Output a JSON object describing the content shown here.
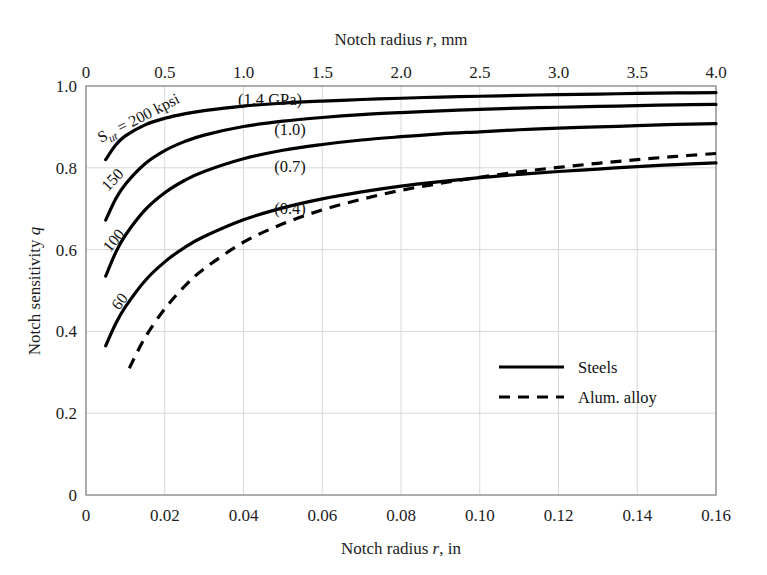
{
  "chart_data": {
    "type": "line",
    "title": "",
    "xlabel": "Notch radius r, in",
    "xlabel_top": "Notch radius r, mm",
    "ylabel": "Notch sensitivity q",
    "xlim": [
      0,
      0.16
    ],
    "ylim": [
      0,
      1.0
    ],
    "xlim_top": [
      0,
      4.0
    ],
    "grid": true,
    "legend_position": "center-right",
    "x_ticks": [
      "0",
      "0.02",
      "0.04",
      "0.06",
      "0.08",
      "0.10",
      "0.12",
      "0.14",
      "0.16"
    ],
    "x_tick_values": [
      0,
      0.02,
      0.04,
      0.06,
      0.08,
      0.1,
      0.12,
      0.14,
      0.16
    ],
    "x_ticks_top": [
      "0",
      "0.5",
      "1.0",
      "1.5",
      "2.0",
      "2.5",
      "3.0",
      "3.5",
      "4.0"
    ],
    "x_tick_values_top": [
      0,
      0.5,
      1.0,
      1.5,
      2.0,
      2.5,
      3.0,
      3.5,
      4.0
    ],
    "y_ticks": [
      "0",
      "0.2",
      "0.4",
      "0.6",
      "0.8",
      "1.0"
    ],
    "y_tick_values": [
      0,
      0.2,
      0.4,
      0.6,
      0.8,
      1.0
    ],
    "series": [
      {
        "name": "Sut = 200 kpsi",
        "label": "S_{ut} = 200 kpsi",
        "gpa_label": "(1.4 GPa)",
        "style": "solid",
        "x": [
          0.005,
          0.0075,
          0.01,
          0.015,
          0.02,
          0.025,
          0.03,
          0.04,
          0.05,
          0.06,
          0.07,
          0.08,
          0.09,
          0.1,
          0.11,
          0.12,
          0.13,
          0.14,
          0.15,
          0.16
        ],
        "y": [
          0.82,
          0.855,
          0.878,
          0.905,
          0.921,
          0.932,
          0.94,
          0.951,
          0.958,
          0.963,
          0.967,
          0.97,
          0.973,
          0.975,
          0.977,
          0.979,
          0.98,
          0.982,
          0.983,
          0.984
        ]
      },
      {
        "name": "Sut = 150 kpsi",
        "label": "150",
        "gpa_label": "(1.0)",
        "style": "solid",
        "x": [
          0.005,
          0.0075,
          0.01,
          0.015,
          0.02,
          0.025,
          0.03,
          0.04,
          0.05,
          0.06,
          0.07,
          0.08,
          0.09,
          0.1,
          0.11,
          0.12,
          0.13,
          0.14,
          0.15,
          0.16
        ],
        "y": [
          0.672,
          0.723,
          0.76,
          0.81,
          0.842,
          0.864,
          0.88,
          0.901,
          0.914,
          0.923,
          0.93,
          0.935,
          0.939,
          0.943,
          0.946,
          0.948,
          0.95,
          0.952,
          0.954,
          0.955
        ]
      },
      {
        "name": "Sut = 100 kpsi",
        "label": "100",
        "gpa_label": "(0.7)",
        "style": "solid",
        "x": [
          0.005,
          0.0075,
          0.01,
          0.015,
          0.02,
          0.025,
          0.03,
          0.04,
          0.05,
          0.06,
          0.07,
          0.08,
          0.09,
          0.1,
          0.11,
          0.12,
          0.13,
          0.14,
          0.15,
          0.16
        ],
        "y": [
          0.535,
          0.592,
          0.635,
          0.697,
          0.739,
          0.769,
          0.791,
          0.822,
          0.843,
          0.857,
          0.868,
          0.876,
          0.883,
          0.888,
          0.893,
          0.897,
          0.9,
          0.903,
          0.906,
          0.908
        ]
      },
      {
        "name": "Sut = 60 kpsi",
        "label": "60",
        "gpa_label": "(0.4)",
        "style": "solid",
        "x": [
          0.005,
          0.0075,
          0.01,
          0.015,
          0.02,
          0.025,
          0.03,
          0.04,
          0.05,
          0.06,
          0.07,
          0.08,
          0.09,
          0.1,
          0.11,
          0.12,
          0.13,
          0.14,
          0.15,
          0.16
        ],
        "y": [
          0.365,
          0.418,
          0.46,
          0.524,
          0.57,
          0.605,
          0.632,
          0.673,
          0.702,
          0.724,
          0.741,
          0.755,
          0.766,
          0.776,
          0.784,
          0.791,
          0.797,
          0.803,
          0.808,
          0.812
        ]
      },
      {
        "name": "Alum. alloy",
        "label": "Alum. alloy",
        "gpa_label": "",
        "style": "dashed",
        "x": [
          0.011,
          0.015,
          0.02,
          0.025,
          0.03,
          0.04,
          0.05,
          0.06,
          0.07,
          0.08,
          0.09,
          0.1,
          0.11,
          0.12,
          0.13,
          0.14,
          0.15,
          0.16
        ],
        "y": [
          0.31,
          0.385,
          0.455,
          0.51,
          0.553,
          0.618,
          0.663,
          0.697,
          0.723,
          0.745,
          0.762,
          0.777,
          0.79,
          0.801,
          0.811,
          0.82,
          0.828,
          0.835
        ]
      }
    ],
    "annotations": [
      {
        "text": "(1.4 GPa)",
        "x": 0.054,
        "y": 0.965
      },
      {
        "text": "(1.0)",
        "x": 0.059,
        "y": 0.9
      },
      {
        "text": "(0.7)",
        "x": 0.059,
        "y": 0.818
      },
      {
        "text": "(0.4)",
        "x": 0.059,
        "y": 0.718
      }
    ],
    "legend": [
      {
        "label": "Steels",
        "style": "solid"
      },
      {
        "label": "Alum. alloy",
        "style": "dashed"
      }
    ]
  },
  "labels": {
    "top_axis_title_a": "Notch radius ",
    "top_axis_title_r": "r",
    "top_axis_title_b": ", mm",
    "bottom_axis_title_a": "Notch radius ",
    "bottom_axis_title_r": "r",
    "bottom_axis_title_b": ", in",
    "y_axis_title_a": "Notch sensitivity ",
    "y_axis_title_q": "q",
    "sut_prefix": "S",
    "sut_sub": "ut",
    "sut_rest": " = 200 kpsi",
    "curve_150": "150",
    "curve_100": "100",
    "curve_60": "60",
    "gpa_14": "(1.4 GPa)",
    "gpa_10": "(1.0)",
    "gpa_07": "(0.7)",
    "gpa_04": "(0.4)",
    "legend_steels": "Steels",
    "legend_alum": "Alum. alloy"
  },
  "colors": {
    "curve": "#000000",
    "grid": "#d8d8d8",
    "frame": "#8a8a8a",
    "text": "#1c1c1c",
    "background": "#ffffff"
  }
}
